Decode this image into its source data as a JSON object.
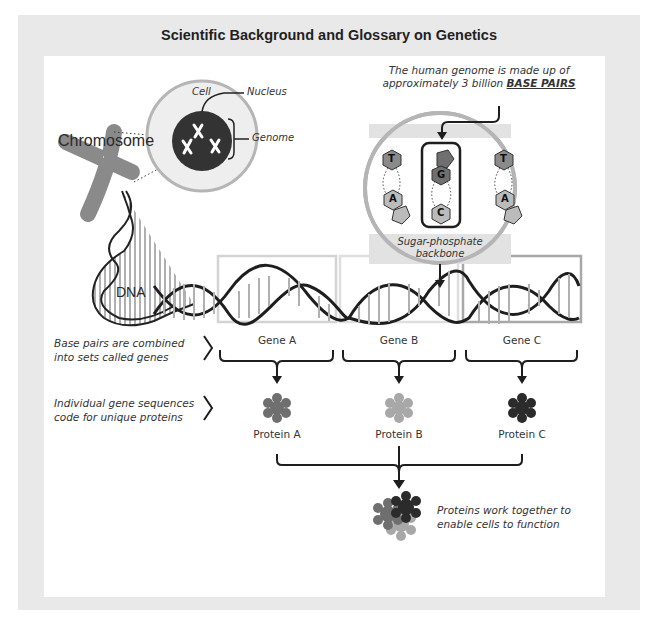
{
  "title": "Scientific Background and Glossary on Genetics",
  "labels": {
    "chromosome": "Chromosome",
    "cell": "Cell",
    "nucleus": "Nucleus",
    "genome": "Genome",
    "dna": "DNA",
    "genome_note_prefix": "The human genome is made up of",
    "genome_note_line2": "approximately 3 billion",
    "genome_note_emphasis": "BASE PAIRS",
    "backbone_line1": "Sugar-phosphate",
    "backbone_line2": "backbone"
  },
  "bases": {
    "left_pair": [
      "T",
      "A"
    ],
    "center_pair": [
      "G",
      "C"
    ],
    "right_pair": [
      "T",
      "A"
    ]
  },
  "genes": [
    {
      "label": "Gene A"
    },
    {
      "label": "Gene B"
    },
    {
      "label": "Gene C"
    }
  ],
  "proteins": [
    {
      "label": "Protein A",
      "color": "#6f6f6f"
    },
    {
      "label": "Protein B",
      "color": "#a8a8a8"
    },
    {
      "label": "Protein C",
      "color": "#2b2b2b"
    }
  ],
  "notes": {
    "genes_line1": "Base pairs are combined",
    "genes_line2": "into sets called genes",
    "proteins_line1": "Individual gene sequences",
    "proteins_line2": "code for unique proteins",
    "together_line1": "Proteins work together to",
    "together_line2": "enable cells to function"
  },
  "colors": {
    "frame": "#e9e9e9",
    "dark": "#262626",
    "mid_gray": "#8a8a8a",
    "light_gray": "#d9d9d9",
    "circle_ring": "#b5b5b5"
  }
}
